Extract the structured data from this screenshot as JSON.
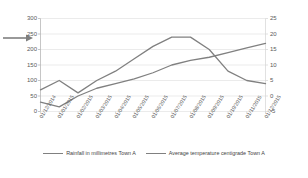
{
  "chart_data": {
    "type": "line",
    "title": "",
    "xlabel": "",
    "ylabel": "",
    "y2label": "",
    "grid": true,
    "legend_position": "bottom",
    "categories": [
      "01/12/2014",
      "01/01/2015",
      "01/02/2015",
      "01/03/2015",
      "01/04/2015",
      "01/05/2015",
      "01/06/2015",
      "01/07/2015",
      "01/08/2015",
      "01/09/2015",
      "01/10/2015",
      "01/11/2015",
      "01/12/2015"
    ],
    "ylim": [
      0,
      300
    ],
    "yticks": [
      0,
      50,
      100,
      150,
      200,
      250,
      300
    ],
    "y2lim": [
      -5,
      25
    ],
    "y2ticks": [
      -5,
      0,
      5,
      10,
      15,
      20,
      25
    ],
    "series": [
      {
        "name": "Rainfall in millimetres Town A",
        "axis": "left",
        "color": "#808080",
        "values": [
          30,
          15,
          50,
          75,
          90,
          105,
          125,
          150,
          165,
          175,
          190,
          205,
          220
        ]
      },
      {
        "name": "Average temperature centigrade Town A",
        "axis": "right",
        "color": "#808080",
        "values": [
          2,
          5,
          1,
          5,
          8,
          12,
          16,
          19,
          19,
          15,
          8,
          5,
          4
        ]
      }
    ]
  },
  "legend": {
    "items": [
      {
        "label": "Rainfall in millimetres Town A"
      },
      {
        "label": "Average temperature centigrade Town A"
      }
    ]
  },
  "annotation": {
    "arrow": "left-arrow-pointer",
    "target_tick": "250"
  }
}
